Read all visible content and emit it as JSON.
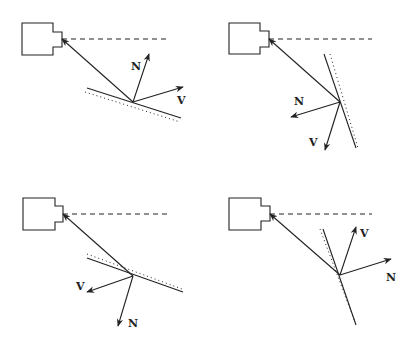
{
  "diagram": {
    "stroke_color": "#222222",
    "panels": [
      {
        "id": "top-left",
        "camera": {
          "x": 22,
          "y": 23,
          "w": 31,
          "h": 32,
          "notch_x": 53,
          "notch_y": 32,
          "notch_w": 9,
          "notch_h": 15
        },
        "dashed": [
          62,
          39,
          170,
          39
        ],
        "ray": [
          62,
          39,
          133,
          102
        ],
        "surface": [
          87,
          88,
          181,
          118
        ],
        "dotted": [
          85,
          92,
          180,
          122
        ],
        "vectors": [
          {
            "label": "N",
            "from": [
              133,
              102
            ],
            "to": [
              149,
              54
            ],
            "label_pos": [
              131,
              70
            ]
          },
          {
            "label": "V",
            "from": [
              133,
              102
            ],
            "to": [
              183,
              87
            ],
            "label_pos": [
              177,
              104
            ]
          }
        ]
      },
      {
        "id": "top-right",
        "camera": {
          "x": 229,
          "y": 23,
          "w": 31,
          "h": 31,
          "notch_x": 260,
          "notch_y": 31,
          "notch_w": 9,
          "notch_h": 16
        },
        "dashed": [
          269,
          39,
          372,
          39
        ],
        "ray": [
          269,
          39,
          340,
          102
        ],
        "surface": [
          324,
          54,
          356,
          148
        ],
        "dotted": [
          330,
          54,
          358,
          148
        ],
        "vectors": [
          {
            "label": "N",
            "from": [
              340,
              102
            ],
            "to": [
              291,
              117
            ],
            "label_pos": [
              294,
              105
            ]
          },
          {
            "label": "V",
            "from": [
              340,
              102
            ],
            "to": [
              325,
              150
            ],
            "label_pos": [
              309,
              146
            ]
          }
        ]
      },
      {
        "id": "bottom-left",
        "camera": {
          "x": 23,
          "y": 198,
          "w": 32,
          "h": 32,
          "notch_x": 55,
          "notch_y": 206,
          "notch_w": 8,
          "notch_h": 16
        },
        "dashed": [
          63,
          214,
          171,
          214
        ],
        "ray": [
          63,
          214,
          133,
          276
        ],
        "surface": [
          87,
          258,
          183,
          292
        ],
        "dotted": [
          87,
          254,
          182,
          289
        ],
        "vectors": [
          {
            "label": "V",
            "from": [
              133,
              276
            ],
            "to": [
              87,
              292
            ],
            "label_pos": [
              76,
              290
            ]
          },
          {
            "label": "N",
            "from": [
              133,
              276
            ],
            "to": [
              118,
              326
            ],
            "label_pos": [
              128,
              327
            ]
          }
        ]
      },
      {
        "id": "bottom-right",
        "camera": {
          "x": 229,
          "y": 198,
          "w": 32,
          "h": 32,
          "notch_x": 261,
          "notch_y": 206,
          "notch_w": 9,
          "notch_h": 15
        },
        "dashed": [
          270,
          214,
          372,
          214
        ],
        "ray": [
          270,
          214,
          340,
          275
        ],
        "surface": [
          323,
          229,
          356,
          325
        ],
        "dotted": [
          320,
          229,
          355,
          322
        ],
        "vectors": [
          {
            "label": "V",
            "from": [
              340,
              275
            ],
            "to": [
              356,
              227
            ],
            "label_pos": [
              360,
              237
            ]
          },
          {
            "label": "N",
            "from": [
              340,
              275
            ],
            "to": [
              391,
              259
            ],
            "label_pos": [
              386,
              281
            ]
          }
        ]
      }
    ]
  }
}
